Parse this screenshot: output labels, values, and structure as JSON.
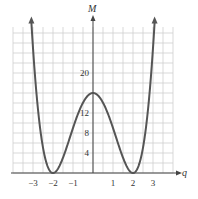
{
  "chart_data": {
    "type": "line",
    "title": "",
    "xlabel": "q",
    "ylabel": "M",
    "function": "M = (q^2 - 4)^2",
    "xlim": [
      -4,
      4
    ],
    "ylim": [
      0,
      29
    ],
    "grid": true,
    "x_ticks": [
      -3,
      -2,
      -1,
      1,
      2,
      3
    ],
    "x_tick_labels": [
      "−3",
      "−2",
      "−1",
      "1",
      "2",
      "3"
    ],
    "y_ticks": [
      4,
      8,
      12,
      20
    ],
    "y_tick_labels": [
      "4",
      "8",
      "12",
      "20"
    ],
    "series": [
      {
        "name": "M(q)",
        "x": [
          -3,
          -2.5,
          -2,
          -1.5,
          -1,
          -0.5,
          0,
          0.5,
          1,
          1.5,
          2,
          2.5,
          3
        ],
        "y": [
          25,
          5.06,
          0,
          3.06,
          9,
          14.06,
          16,
          14.06,
          9,
          3.06,
          0,
          5.06,
          25
        ]
      }
    ],
    "key_points": {
      "local_max": {
        "q": 0,
        "M": 16
      },
      "minima": [
        {
          "q": -2,
          "M": 0
        },
        {
          "q": 2,
          "M": 0
        }
      ]
    },
    "arrows": "curve ends with arrowheads pointing up at both sides; axes end with arrowheads",
    "line_color": "#555555",
    "grid_color": "#cfcfcf"
  }
}
